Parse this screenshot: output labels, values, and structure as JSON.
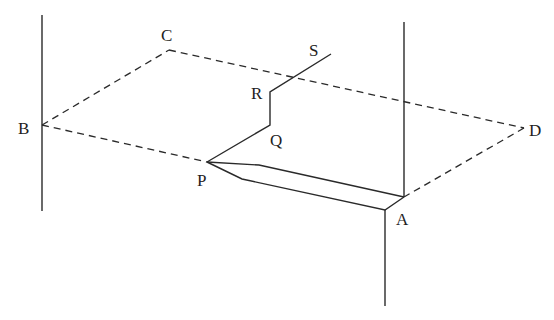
{
  "diagram": {
    "type": "geometry-3d-plane-figure",
    "labels": {
      "A": "A",
      "B": "B",
      "C": "C",
      "D": "D",
      "P": "P",
      "Q": "Q",
      "R": "R",
      "S": "S"
    },
    "points": {
      "B": [
        42,
        125
      ],
      "C": [
        169,
        50
      ],
      "D": [
        524,
        128
      ],
      "A": [
        404,
        197
      ],
      "P": [
        207,
        162
      ],
      "Q": [
        270,
        125
      ],
      "R": [
        270,
        92
      ],
      "S": [
        331,
        54
      ]
    },
    "dashed_plane": [
      "B",
      "C",
      "D",
      "A",
      "P",
      "B"
    ],
    "vertical_lines": [
      {
        "x": 42,
        "y1": 15,
        "y2": 211
      },
      {
        "x": 404,
        "y1": 22,
        "y2": 197
      },
      {
        "x": 385,
        "y1": 210,
        "y2": 306
      }
    ],
    "colors": {
      "line": "#2a2a2a",
      "background": "#ffffff"
    }
  }
}
